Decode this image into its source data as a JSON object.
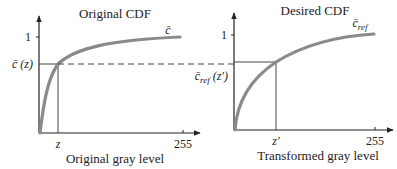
{
  "figure": {
    "left_panel": {
      "title": "Original CDF",
      "xlabel": "Original gray level",
      "y_tick_one": "1",
      "y_marker_label": "c̄ (z)",
      "x_marker_label": "z",
      "x_max_label": "255",
      "curve_label": "c̄"
    },
    "right_panel": {
      "title": "Desired CDF",
      "xlabel": "Transformed gray level",
      "y_tick_one": "1",
      "y_marker_label": "c̄ref (z′)",
      "y_marker_base": "c̄",
      "y_marker_sub": "ref",
      "y_marker_arg": " (z′)",
      "x_marker_label": "z′",
      "x_max_label": "255",
      "curve_label_base": "c̄",
      "curve_label_sub": "ref"
    },
    "colors": {
      "curve": "#8a8a8a",
      "axis": "#222222",
      "guide": "#555555"
    }
  }
}
